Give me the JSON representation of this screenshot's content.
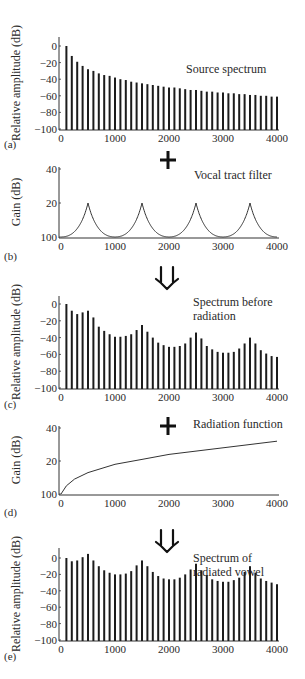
{
  "figure": {
    "panels": [
      {
        "id": "a",
        "label": "(a)",
        "kind": "bars",
        "annotation": [
          "Source spectrum"
        ],
        "operator": "plus",
        "ylabel": "Relative amplitude (dB)",
        "yticks": [
          "0",
          "−20",
          "−40",
          "−60",
          "−80",
          "−100"
        ],
        "xticks": [
          "0",
          "1000",
          "2000",
          "3000",
          "4000"
        ]
      },
      {
        "id": "b",
        "label": "(b)",
        "kind": "curve",
        "annotation": [
          "Vocal tract filter"
        ],
        "operator": "arrow",
        "ylabel": "Gain (dB)",
        "yticks": [
          "40",
          "20",
          "100"
        ],
        "xticks": [
          "0",
          "1000",
          "2000",
          "3000",
          "4000"
        ]
      },
      {
        "id": "c",
        "label": "(c)",
        "kind": "bars",
        "annotation": [
          "Spectrum before",
          "radiation"
        ],
        "operator": "plus",
        "ylabel": "Relative amplitude (dB)",
        "yticks": [
          "0",
          "−20",
          "−40",
          "−60",
          "−80",
          "−100"
        ],
        "xticks": [
          "0",
          "1000",
          "2000",
          "3000",
          "4000"
        ]
      },
      {
        "id": "d",
        "label": "(d)",
        "kind": "curve",
        "annotation": [
          "Radiation function"
        ],
        "operator": "arrow",
        "ylabel": "Gain (dB)",
        "yticks": [
          "40",
          "20",
          "100"
        ],
        "xticks": [
          "0",
          "1000",
          "2000",
          "3000",
          "4000"
        ]
      },
      {
        "id": "e",
        "label": "(e)",
        "kind": "bars",
        "annotation": [
          "Spectrum of",
          "radiated vowel"
        ],
        "operator": null,
        "ylabel": "Relative amplitude (dB)",
        "yticks": [
          "0",
          "−20",
          "−40",
          "−60",
          "−80",
          "−100"
        ],
        "xticks": [
          "0",
          "1000",
          "2000",
          "3000",
          "4000"
        ]
      }
    ]
  },
  "chart_data": [
    {
      "type": "bar",
      "panel": "(a)",
      "title": "Source spectrum",
      "xlabel": "",
      "ylabel": "Relative amplitude (dB)",
      "xlim": [
        0,
        4000
      ],
      "ylim": [
        -100,
        0
      ],
      "x": [
        100,
        200,
        300,
        400,
        500,
        600,
        700,
        800,
        900,
        1000,
        1100,
        1200,
        1300,
        1400,
        1500,
        1600,
        1700,
        1800,
        1900,
        2000,
        2100,
        2200,
        2300,
        2400,
        2500,
        2600,
        2700,
        2800,
        2900,
        3000,
        3100,
        3200,
        3300,
        3400,
        3500,
        3600,
        3700,
        3800,
        3900,
        4000
      ],
      "values": [
        0,
        -12,
        -19,
        -24,
        -28,
        -30,
        -33,
        -35,
        -36,
        -38,
        -40,
        -41,
        -43,
        -44,
        -45,
        -46,
        -47,
        -48,
        -49,
        -50,
        -50,
        -51,
        -52,
        -53,
        -53,
        -54,
        -55,
        -55,
        -56,
        -56,
        -57,
        -57,
        -58,
        -58,
        -59,
        -59,
        -60,
        -60,
        -61,
        -61
      ]
    },
    {
      "type": "line",
      "panel": "(b)",
      "title": "Vocal tract filter",
      "xlabel": "",
      "ylabel": "Gain (dB)",
      "xlim": [
        0,
        4000
      ],
      "ylim": [
        0,
        40
      ],
      "peaks_hz": [
        500,
        1500,
        2500,
        3500
      ],
      "peak_gain_db": 20,
      "minima_hz": [
        0,
        1000,
        2000,
        3000,
        4000
      ],
      "minima_gain_db": 0
    },
    {
      "type": "bar",
      "panel": "(c)",
      "title": "Spectrum before radiation",
      "xlabel": "",
      "ylabel": "Relative amplitude (dB)",
      "xlim": [
        0,
        4000
      ],
      "ylim": [
        -100,
        0
      ],
      "x": [
        100,
        200,
        300,
        400,
        500,
        600,
        700,
        800,
        900,
        1000,
        1100,
        1200,
        1300,
        1400,
        1500,
        1600,
        1700,
        1800,
        1900,
        2000,
        2100,
        2200,
        2300,
        2400,
        2500,
        2600,
        2700,
        2800,
        2900,
        3000,
        3100,
        3200,
        3300,
        3400,
        3500,
        3600,
        3700,
        3800,
        3900,
        4000
      ],
      "values": [
        0,
        -8,
        -12,
        -10,
        -8,
        -16,
        -27,
        -32,
        -36,
        -39,
        -39,
        -38,
        -36,
        -31,
        -25,
        -33,
        -40,
        -46,
        -49,
        -51,
        -51,
        -50,
        -47,
        -40,
        -34,
        -41,
        -50,
        -54,
        -57,
        -58,
        -58,
        -57,
        -53,
        -47,
        -40,
        -47,
        -55,
        -59,
        -62,
        -63
      ]
    },
    {
      "type": "line",
      "panel": "(d)",
      "title": "Radiation function",
      "xlabel": "",
      "ylabel": "Gain (dB)",
      "xlim": [
        0,
        4000
      ],
      "ylim": [
        0,
        40
      ],
      "x": [
        0,
        100,
        250,
        500,
        1000,
        1500,
        2000,
        2500,
        3000,
        3500,
        4000
      ],
      "values": [
        0,
        5,
        9,
        13,
        18,
        21,
        24,
        26,
        28,
        30,
        32
      ]
    },
    {
      "type": "bar",
      "panel": "(e)",
      "title": "Spectrum of radiated vowel",
      "xlabel": "",
      "ylabel": "Relative amplitude (dB)",
      "xlim": [
        0,
        4000
      ],
      "ylim": [
        -100,
        10
      ],
      "x": [
        100,
        200,
        300,
        400,
        500,
        600,
        700,
        800,
        900,
        1000,
        1100,
        1200,
        1300,
        1400,
        1500,
        1600,
        1700,
        1800,
        1900,
        2000,
        2100,
        2200,
        2300,
        2400,
        2500,
        2600,
        2700,
        2800,
        2900,
        3000,
        3100,
        3200,
        3300,
        3400,
        3500,
        3600,
        3700,
        3800,
        3900,
        4000
      ],
      "values": [
        0,
        -4,
        -3,
        1,
        5,
        -3,
        -10,
        -15,
        -18,
        -20,
        -20,
        -19,
        -16,
        -9,
        -3,
        -10,
        -17,
        -22,
        -25,
        -26,
        -26,
        -24,
        -20,
        -14,
        -7,
        -15,
        -21,
        -26,
        -28,
        -29,
        -29,
        -27,
        -24,
        -17,
        -10,
        -18,
        -25,
        -28,
        -30,
        -32
      ]
    }
  ]
}
